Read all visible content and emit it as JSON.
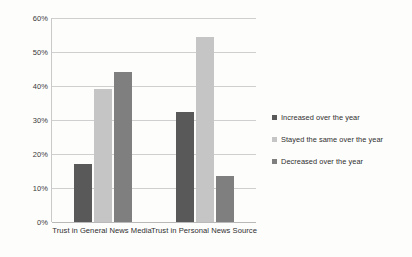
{
  "chart_data": {
    "type": "bar",
    "title": "",
    "subtitle": "",
    "xlabel": "",
    "ylabel": "",
    "ylim": [
      0,
      60
    ],
    "ytick_labels": [
      "0%",
      "10%",
      "20%",
      "30%",
      "40%",
      "50%",
      "60%"
    ],
    "ytick_values": [
      0,
      10,
      20,
      30,
      40,
      50,
      60
    ],
    "grid": true,
    "legend_position": "right",
    "value_suffix": "%",
    "categories": [
      "Trust in General News Media",
      "Trust in Personal News Source"
    ],
    "series": [
      {
        "name": "Increased over the year",
        "color": "#595959",
        "values": [
          17,
          32.5
        ]
      },
      {
        "name": "Stayed the same over the year",
        "color": "#c5c5c5",
        "values": [
          39,
          54.5
        ]
      },
      {
        "name": "Decreased over the year",
        "color": "#7f7f7f",
        "values": [
          44,
          13.5
        ]
      }
    ]
  }
}
